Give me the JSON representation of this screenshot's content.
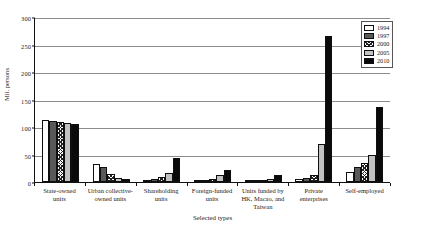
{
  "chart_data": {
    "type": "bar",
    "title": "",
    "xlabel": "Selected types",
    "ylabel": "Mil. persons",
    "ylim": [
      0,
      300
    ],
    "yticks": [
      0,
      50,
      100,
      150,
      200,
      250,
      300
    ],
    "grid": true,
    "legend_position": "top-right",
    "categories": [
      "State-owned units",
      "Urban collective-owned units",
      "Shareholding units",
      "Foreign-funded units",
      "Units funded by HK, Macao, and Taiwan",
      "Private enterprises",
      "Self-employed"
    ],
    "category_lines": [
      [
        "State-owned",
        "units"
      ],
      [
        "Urban collective-",
        "owned units"
      ],
      [
        "Shareholding",
        "units"
      ],
      [
        "Foreign-funded",
        "units"
      ],
      [
        "Units funded by",
        "HK, Macao, and",
        "Taiwan"
      ],
      [
        "Private",
        "enterprises"
      ],
      [
        "Self-employed"
      ]
    ],
    "series": [
      {
        "name": "1994",
        "fill": "white",
        "values": [
          112,
          32,
          2,
          2,
          2,
          6,
          18
        ]
      },
      {
        "name": "1997",
        "fill": "dark-gray",
        "values": [
          111,
          28,
          5,
          3,
          3,
          8,
          27
        ]
      },
      {
        "name": "2000",
        "fill": "crosshatch",
        "values": [
          109,
          15,
          9,
          6,
          3,
          12,
          34
        ]
      },
      {
        "name": "2005",
        "fill": "light-gray",
        "values": [
          107,
          8,
          17,
          12,
          6,
          70,
          50
        ]
      },
      {
        "name": "2010",
        "fill": "black",
        "values": [
          105,
          6,
          43,
          22,
          13,
          265,
          137
        ]
      }
    ]
  },
  "legend": {
    "items": [
      {
        "label": "1994",
        "fill": "white"
      },
      {
        "label": "1997",
        "fill": "dark-gray"
      },
      {
        "label": "2000",
        "fill": "crosshatch"
      },
      {
        "label": "2005",
        "fill": "light-gray"
      },
      {
        "label": "2010",
        "fill": "black"
      }
    ]
  },
  "colors": {
    "axis": "#111111",
    "grid": "#8c8c8c",
    "bar_1994": "#ffffff",
    "bar_1997": "#595959",
    "bar_2000": "#222222",
    "bar_2005": "#c2c2c2",
    "bar_2010": "#0a0a0a"
  }
}
